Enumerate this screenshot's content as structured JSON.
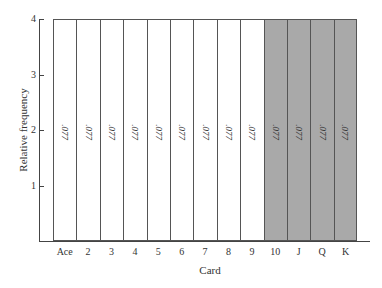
{
  "chart_data": {
    "type": "bar",
    "title": "",
    "xlabel": "Card",
    "ylabel": "Relative frequency",
    "categories": [
      "Ace",
      "2",
      "3",
      "4",
      "5",
      "6",
      "7",
      "8",
      "9",
      "10",
      "J",
      "Q",
      "K"
    ],
    "values": [
      0.077,
      0.077,
      0.077,
      0.077,
      0.077,
      0.077,
      0.077,
      0.077,
      0.077,
      0.077,
      0.077,
      0.077,
      0.077
    ],
    "bar_labels": [
      ".077",
      ".077",
      ".077",
      ".077",
      ".077",
      ".077",
      ".077",
      ".077",
      ".077",
      ".077",
      ".077",
      ".077",
      ".077"
    ],
    "bar_colors": [
      "#ffffff",
      "#ffffff",
      "#ffffff",
      "#ffffff",
      "#ffffff",
      "#ffffff",
      "#ffffff",
      "#ffffff",
      "#ffffff",
      "#a9a9a9",
      "#a9a9a9",
      "#a9a9a9",
      "#a9a9a9"
    ],
    "y_ticks": [
      "1",
      "2",
      "3",
      "4"
    ],
    "ylim": [
      0,
      4
    ],
    "grid": false,
    "legend": null
  }
}
